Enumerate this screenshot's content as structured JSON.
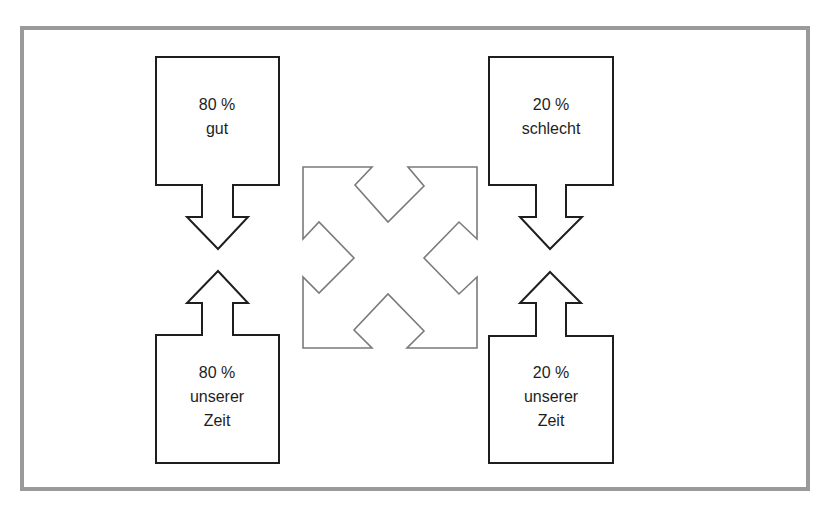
{
  "diagram": {
    "boxes": [
      {
        "id": "top-left",
        "lines": [
          "80 %",
          "gut"
        ],
        "arrow": "down"
      },
      {
        "id": "top-right",
        "lines": [
          "20 %",
          "schlecht"
        ],
        "arrow": "down"
      },
      {
        "id": "bottom-left",
        "lines": [
          "80 %",
          "unserer",
          "Zeit"
        ],
        "arrow": "up"
      },
      {
        "id": "bottom-right",
        "lines": [
          "20 %",
          "unserer",
          "Zeit"
        ],
        "arrow": "up"
      }
    ],
    "center_symbol": "four-way-diagonal-arrows",
    "colors": {
      "frame": "#9a9a9a",
      "box_stroke": "#1e1e1e",
      "center_stroke": "#7a7a7a",
      "text": "#1e1e1e"
    }
  }
}
